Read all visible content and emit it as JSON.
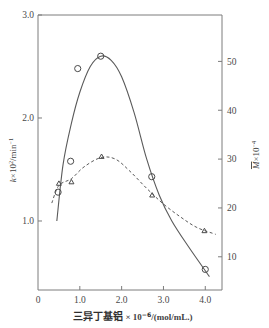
{
  "figure": {
    "background_color": "#ffffff",
    "axis_color": "#7c7c7c",
    "marker_color": "#4a4a4a",
    "curve_color": "#5a5a5a",
    "top_title_faint": ""
  },
  "axes": {
    "x": {
      "label_cn": "三异丁基铝",
      "label_mult": "× 10",
      "label_exp": "−6",
      "label_unit": "/(mol/mL.)",
      "ticks": [
        "0",
        "1.0",
        "2.0",
        "3.0",
        "4.0"
      ],
      "tick_values": [
        0,
        1.0,
        2.0,
        3.0,
        4.0
      ],
      "range": [
        0,
        4.4
      ]
    },
    "y_left": {
      "label_main": "k",
      "label_mult": "×10",
      "label_exp": "2",
      "label_unit": "/min",
      "label_unit_exp": "−1",
      "ticks": [
        "1.0",
        "2.0",
        "3.0"
      ],
      "tick_values": [
        1.0,
        2.0,
        3.0
      ],
      "range": [
        0.33,
        3.0
      ]
    },
    "y_right": {
      "label_main": "M",
      "label_mult": "×10",
      "label_exp": "−4",
      "ticks": [
        "10",
        "20",
        "30",
        "40",
        "50"
      ],
      "tick_values": [
        10,
        20,
        30,
        40,
        50
      ],
      "range": [
        3.2,
        59.5
      ]
    }
  },
  "chart_data": {
    "type": "line",
    "title": "",
    "xlabel": "三异丁基铝 × 10−6/(mol/mL.)",
    "ylabel": "k×102/min−1",
    "ylabel_right": "M×10−4",
    "xlim": [
      0,
      4.4
    ],
    "ylim": [
      0.33,
      3.0
    ],
    "ylim_right": [
      3.2,
      59.5
    ],
    "grid": false,
    "legend": "none",
    "series": [
      {
        "name": "k×10^2/min^-1",
        "marker": "circle",
        "line_style": "solid",
        "axis": "left",
        "points": [
          {
            "x": 0.48,
            "y": 1.28
          },
          {
            "x": 0.78,
            "y": 1.58
          },
          {
            "x": 0.95,
            "y": 2.48
          },
          {
            "x": 1.5,
            "y": 2.6
          },
          {
            "x": 2.72,
            "y": 1.43
          },
          {
            "x": 4.0,
            "y": 0.53
          }
        ],
        "curve": [
          {
            "x": 0.45,
            "y": 1.0
          },
          {
            "x": 0.6,
            "y": 1.55
          },
          {
            "x": 0.8,
            "y": 1.95
          },
          {
            "x": 1.0,
            "y": 2.25
          },
          {
            "x": 1.25,
            "y": 2.5
          },
          {
            "x": 1.5,
            "y": 2.6
          },
          {
            "x": 1.75,
            "y": 2.56
          },
          {
            "x": 2.0,
            "y": 2.4
          },
          {
            "x": 2.3,
            "y": 2.05
          },
          {
            "x": 2.6,
            "y": 1.6
          },
          {
            "x": 2.9,
            "y": 1.25
          },
          {
            "x": 3.2,
            "y": 1.0
          },
          {
            "x": 3.6,
            "y": 0.75
          },
          {
            "x": 4.1,
            "y": 0.46
          }
        ]
      },
      {
        "name": "M×10^-4",
        "marker": "triangle",
        "line_style": "dashed",
        "axis": "right",
        "points": [
          {
            "x": 0.5,
            "y": 25.0
          },
          {
            "x": 0.8,
            "y": 25.3
          },
          {
            "x": 1.52,
            "y": 30.5
          },
          {
            "x": 2.73,
            "y": 22.6
          },
          {
            "x": 3.98,
            "y": 15.3
          }
        ],
        "curve": [
          {
            "x": 0.33,
            "y": 21.0
          },
          {
            "x": 0.5,
            "y": 24.6
          },
          {
            "x": 0.8,
            "y": 26.0
          },
          {
            "x": 1.1,
            "y": 28.4
          },
          {
            "x": 1.5,
            "y": 30.3
          },
          {
            "x": 1.85,
            "y": 30.0
          },
          {
            "x": 2.2,
            "y": 27.5
          },
          {
            "x": 2.6,
            "y": 24.0
          },
          {
            "x": 3.0,
            "y": 20.8
          },
          {
            "x": 3.4,
            "y": 18.2
          },
          {
            "x": 3.8,
            "y": 16.0
          },
          {
            "x": 4.25,
            "y": 14.6
          }
        ]
      }
    ]
  }
}
